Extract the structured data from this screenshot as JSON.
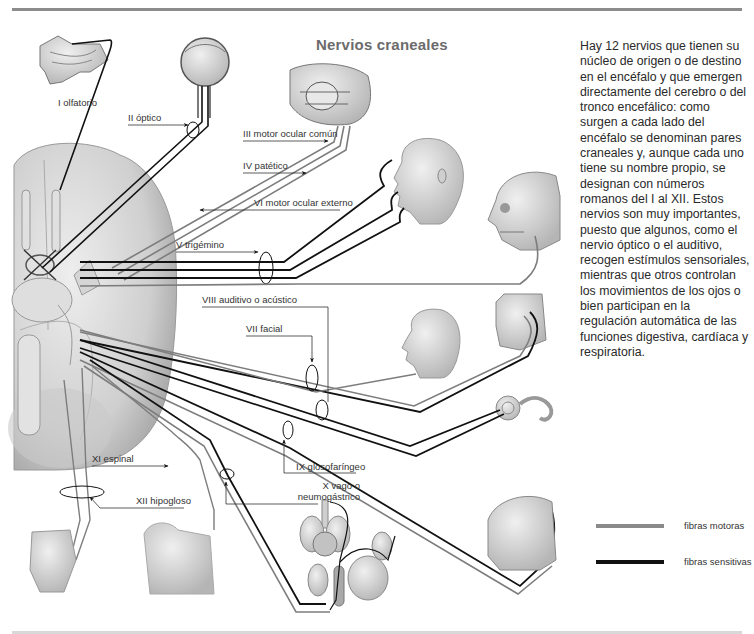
{
  "title": "Nervios craneales",
  "description": "Hay 12 nervios que tienen su núcleo de origen o de destino en el encéfalo y que emergen directamente del cerebro o del tronco encefálico: como surgen a cada lado del encéfalo se denominan pares craneales y, aunque cada uno tiene su nombre propio, se designan con números romanos del I al XII. Estos nervios son muy importantes, puesto que algunos, como el nervio óptico o el auditivo, recogen estímulos sensoriales, mientras que otros controlan los movimientos de los ojos o bien participan en la regulación automática de las funciones digestiva, cardíaca y respiratoria.",
  "nerves": [
    {
      "numeral": "I",
      "label": "I olfatorio"
    },
    {
      "numeral": "II",
      "label": "II óptico"
    },
    {
      "numeral": "III",
      "label": "III motor ocular común"
    },
    {
      "numeral": "IV",
      "label": "IV patético"
    },
    {
      "numeral": "VI",
      "label": "VI motor ocular externo"
    },
    {
      "numeral": "V",
      "label": "V trigémino"
    },
    {
      "numeral": "VIII",
      "label": "VIII auditivo o acústico"
    },
    {
      "numeral": "VII",
      "label": "VII facial"
    },
    {
      "numeral": "IX",
      "label": "IX glosofaríngeo"
    },
    {
      "numeral": "X",
      "label_line1": "X vago o",
      "label_line2": "neumogástrico"
    },
    {
      "numeral": "XI",
      "label": "XI espinal"
    },
    {
      "numeral": "XII",
      "label": "XII hipogloso"
    }
  ],
  "legend": [
    {
      "label": "fibras motoras",
      "color": "#8a8a8a"
    },
    {
      "label": "fibras sensitivas",
      "color": "#111111"
    }
  ],
  "colors": {
    "motor": "#8a8a8a",
    "sensory": "#111111",
    "tissue": "#d9d9d9",
    "title": "#6b6b6b"
  }
}
